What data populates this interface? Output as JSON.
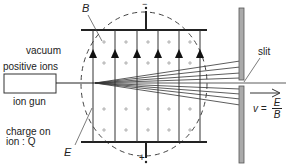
{
  "diagram": {
    "labels": {
      "magnetic_field": "B",
      "vacuum": "vacuum",
      "positive_ions": "positive ions",
      "ion_gun": "ion gun",
      "charge_on": "charge on",
      "ion_charge": "ion : Q",
      "electric_field": "E",
      "slit": "slit",
      "velocity_lhs": "v =",
      "velocity_num": "E",
      "velocity_den": "B",
      "top_plate_sign": "−",
      "bottom_plate_sign": "+"
    },
    "field_lines": {
      "count": 6,
      "direction": "up"
    },
    "magnetic_field_symbol": "+",
    "colors": {
      "line": "#222222",
      "plate": "#aaaaaa",
      "dashed": "#444444"
    }
  }
}
